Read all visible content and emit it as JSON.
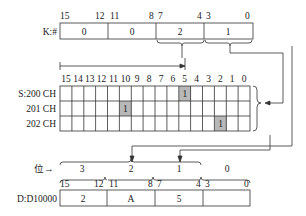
{
  "k_register": {
    "label": "K:#",
    "bit_labels": [
      "15",
      "12",
      "11",
      "8",
      "7",
      "4",
      "3",
      "0"
    ],
    "nibbles": [
      "0",
      "0",
      "2",
      "1"
    ]
  },
  "source_grid": {
    "bit_headers": [
      "15",
      "14",
      "13",
      "12",
      "11",
      "10",
      "9",
      "8",
      "7",
      "6",
      "5",
      "4",
      "3",
      "2",
      "1",
      "0"
    ],
    "rows": [
      {
        "label": "S:200 CH",
        "set_bit": 5,
        "value": "1"
      },
      {
        "label": "201 CH",
        "set_bit": 10,
        "value": "1"
      },
      {
        "label": "202 CH",
        "set_bit": 2,
        "value": "1"
      }
    ],
    "highlight_color": "#b8b8b8"
  },
  "digit_labels": {
    "prefix": "位→",
    "digits": [
      "3",
      "2",
      "1",
      "0"
    ]
  },
  "d_register": {
    "label": "D:D10000",
    "bit_labels": [
      "15",
      "12",
      "11",
      "8",
      "7",
      "4",
      "3",
      "0"
    ],
    "nibbles": [
      "2",
      "A",
      "5",
      ""
    ]
  }
}
